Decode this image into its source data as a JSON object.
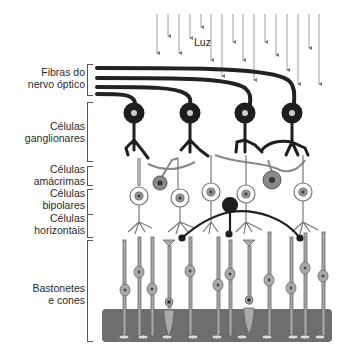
{
  "diagram": {
    "type": "retina-layers-schematic",
    "light_label": "Luz",
    "layers": [
      {
        "id": "optic-fibers",
        "line1": "Fibras do",
        "line2": "nervo óptico",
        "top": 62,
        "height": 30
      },
      {
        "id": "ganglion",
        "line1": "Células",
        "line2": "ganglionares",
        "top": 102,
        "height": 58
      },
      {
        "id": "amacrine",
        "line1": "Células",
        "line2": "amácrimas",
        "top": 166,
        "height": 20
      },
      {
        "id": "bipolar",
        "line1": "Células",
        "line2": "bipolares",
        "top": 190,
        "height": 26
      },
      {
        "id": "horizontal",
        "line1": "Células",
        "line2": "horizontais",
        "top": 212,
        "height": 24
      },
      {
        "id": "rods-cones",
        "line1": "Bastonetes",
        "line2": "e cones",
        "top": 240,
        "height": 100
      }
    ],
    "colors": {
      "ink": "#2a2a2a",
      "ganglion": "#1e1e1e",
      "amacrine": "#8a8a8a",
      "bipolar_fill": "#ffffff",
      "photoreceptor": "#a9a9a9",
      "epithelium": "#6e6e6e",
      "arrow": "#777777"
    }
  }
}
